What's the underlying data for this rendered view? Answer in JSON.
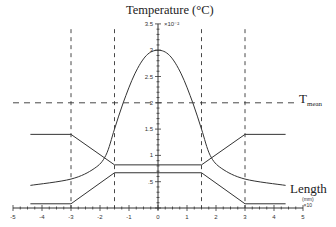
{
  "chart_data": {
    "type": "line",
    "title": "Temperature (°C)",
    "ylabel": "Temperature (°C)",
    "y_multiplier": "×10^2",
    "xlabel": "Length (mm)",
    "x_multiplier": "×10",
    "xlim": [
      -5,
      5
    ],
    "ylim": [
      0,
      3.5
    ],
    "x_ticks": [
      "-5",
      "-4",
      "-3",
      "-2",
      "-1",
      "0",
      "1",
      "2",
      "3",
      "4",
      "5"
    ],
    "y_ticks": [
      ".5",
      "1",
      "1.5",
      "2",
      "2.5",
      "3",
      "3.5"
    ],
    "grid": false,
    "reference_lines": [
      {
        "type": "horizontal",
        "value": 2.0,
        "style": "dashed",
        "label": "T_mean"
      },
      {
        "type": "vertical",
        "value": -3,
        "style": "dashed"
      },
      {
        "type": "vertical",
        "value": -1.5,
        "style": "dashed"
      },
      {
        "type": "vertical",
        "value": 1.5,
        "style": "dashed"
      },
      {
        "type": "vertical",
        "value": 3,
        "style": "dashed"
      }
    ],
    "series": [
      {
        "name": "Temperature profile",
        "x": [
          -4.4,
          -3,
          -2.2,
          -1.8,
          -1.5,
          -1.2,
          -0.8,
          -0.4,
          0,
          0.4,
          0.8,
          1.2,
          1.5,
          1.8,
          2.2,
          3,
          4.4
        ],
        "y": [
          0.43,
          0.55,
          0.75,
          1.0,
          1.5,
          2.0,
          2.55,
          2.9,
          3.0,
          2.9,
          2.55,
          2.0,
          1.5,
          1.0,
          0.75,
          0.55,
          0.43
        ]
      },
      {
        "name": "Upper boundary",
        "x": [
          -4.4,
          -3,
          -1.5,
          1.5,
          3,
          4.4
        ],
        "y": [
          1.4,
          1.4,
          0.82,
          0.82,
          1.4,
          1.4
        ]
      },
      {
        "name": "Lower boundary",
        "x": [
          -4.4,
          -3,
          -1.5,
          1.5,
          3,
          4.4
        ],
        "y": [
          0.08,
          0.08,
          0.67,
          0.67,
          0.08,
          0.08
        ]
      }
    ]
  },
  "labels": {
    "title": "Temperature (°C)",
    "tmean_main": "T",
    "tmean_sub": "mean",
    "length": "Length",
    "length_unit": "(mm)",
    "x_multiplier": "×10",
    "y_multiplier": "×10⁻²"
  }
}
